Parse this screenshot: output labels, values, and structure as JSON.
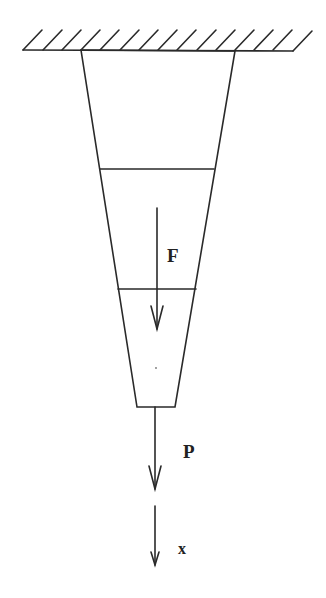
{
  "diagram": {
    "title": "",
    "labels": {
      "force_internal": "F",
      "force_applied": "P",
      "axis": "x"
    },
    "colors": {
      "stroke": "#2a2a2a",
      "background": "#ffffff"
    },
    "elements": [
      {
        "type": "fixed-support",
        "description": "hatched ceiling"
      },
      {
        "type": "tapered-bar",
        "description": "trapezoid bar hanging from support, narrowing downward"
      },
      {
        "type": "section-line",
        "index": 1
      },
      {
        "type": "section-line",
        "index": 2
      },
      {
        "type": "arrow",
        "label": "F",
        "direction": "down"
      },
      {
        "type": "arrow",
        "label": "P",
        "direction": "down"
      },
      {
        "type": "arrow",
        "label": "x",
        "direction": "down"
      }
    ]
  }
}
